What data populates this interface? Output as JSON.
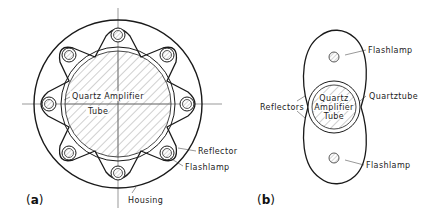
{
  "figure_a": {
    "panel_label_open": "(",
    "panel_letter": "a",
    "panel_label_close": ")",
    "tube_label_line1": "Quartz Amplifier",
    "tube_label_line2": "Tube",
    "reflector_label": "Reflector",
    "flashlamp_label": "Flashlamp",
    "housing_label": "Housing",
    "lamp_count": 8
  },
  "figure_b": {
    "panel_label_open": "(",
    "panel_letter": "b",
    "panel_label_close": ")",
    "flashlamp_top_label": "Flashlamp",
    "flashlamp_bottom_label": "Flashlamp",
    "quartztube_label": "Quartztube",
    "reflectors_label": "Reflectors",
    "tube_label_line1": "Quartz",
    "tube_label_line2": "Amplifier",
    "tube_label_line3": "Tube"
  },
  "colors": {
    "line": "#1a1a1a",
    "lamp_fill": "#b8b8b8",
    "hatch": "#8a8a8a",
    "background": "#ffffff"
  }
}
